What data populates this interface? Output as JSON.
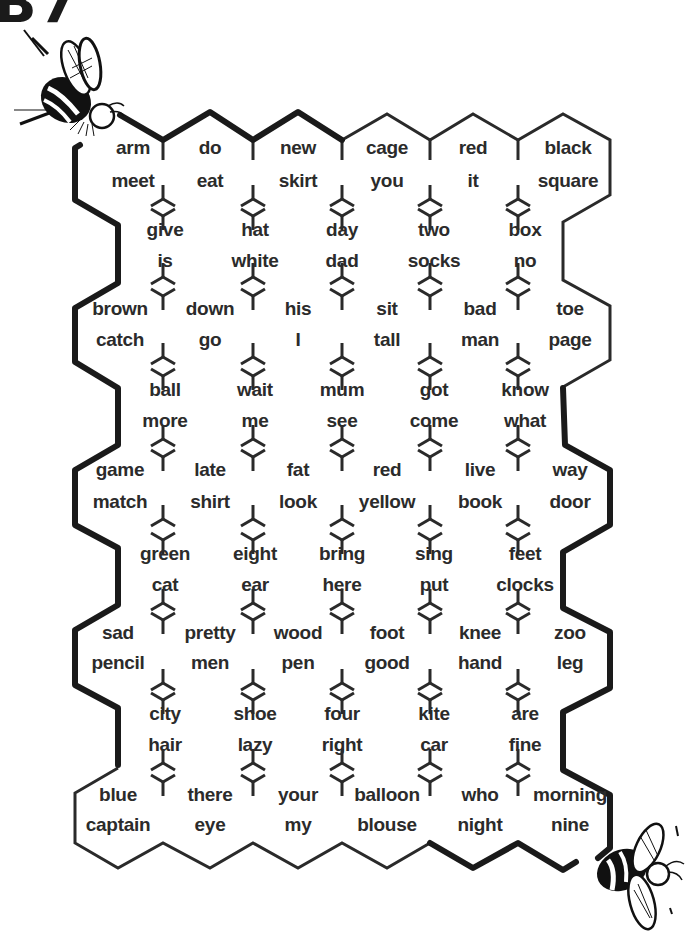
{
  "heading": "B7",
  "rows": [
    {
      "y1": 150,
      "y2": 183,
      "cells": [
        {
          "x": 133,
          "top": "arm",
          "bottom": "meet"
        },
        {
          "x": 210,
          "top": "do",
          "bottom": "eat"
        },
        {
          "x": 298,
          "top": "new",
          "bottom": "skirt"
        },
        {
          "x": 387,
          "top": "cage",
          "bottom": "you"
        },
        {
          "x": 473,
          "top": "red",
          "bottom": "it"
        },
        {
          "x": 568,
          "top": "black",
          "bottom": "square"
        }
      ]
    },
    {
      "y1": 232,
      "y2": 263,
      "cells": [
        {
          "x": 165,
          "top": "give",
          "bottom": "is"
        },
        {
          "x": 255,
          "top": "hat",
          "bottom": "white"
        },
        {
          "x": 342,
          "top": "day",
          "bottom": "dad"
        },
        {
          "x": 434,
          "top": "two",
          "bottom": "socks"
        },
        {
          "x": 525,
          "top": "box",
          "bottom": "no"
        }
      ]
    },
    {
      "y1": 311,
      "y2": 342,
      "cells": [
        {
          "x": 120,
          "top": "brown",
          "bottom": "catch"
        },
        {
          "x": 210,
          "top": "down",
          "bottom": "go"
        },
        {
          "x": 298,
          "top": "his",
          "bottom": "I"
        },
        {
          "x": 387,
          "top": "sit",
          "bottom": "tall"
        },
        {
          "x": 480,
          "top": "bad",
          "bottom": "man"
        },
        {
          "x": 570,
          "top": "toe",
          "bottom": "page"
        }
      ]
    },
    {
      "y1": 392,
      "y2": 423,
      "cells": [
        {
          "x": 165,
          "top": "ball",
          "bottom": "more"
        },
        {
          "x": 255,
          "top": "wait",
          "bottom": "me"
        },
        {
          "x": 342,
          "top": "mum",
          "bottom": "see"
        },
        {
          "x": 434,
          "top": "got",
          "bottom": "come"
        },
        {
          "x": 525,
          "top": "know",
          "bottom": "what"
        }
      ]
    },
    {
      "y1": 472,
      "y2": 504,
      "cells": [
        {
          "x": 120,
          "top": "game",
          "bottom": "match"
        },
        {
          "x": 210,
          "top": "late",
          "bottom": "shirt"
        },
        {
          "x": 298,
          "top": "fat",
          "bottom": "look"
        },
        {
          "x": 387,
          "top": "red",
          "bottom": "yellow"
        },
        {
          "x": 480,
          "top": "live",
          "bottom": "book"
        },
        {
          "x": 570,
          "top": "way",
          "bottom": "door"
        }
      ]
    },
    {
      "y1": 556,
      "y2": 587,
      "cells": [
        {
          "x": 165,
          "top": "green",
          "bottom": "cat"
        },
        {
          "x": 255,
          "top": "eight",
          "bottom": "ear"
        },
        {
          "x": 342,
          "top": "bring",
          "bottom": "here"
        },
        {
          "x": 434,
          "top": "sing",
          "bottom": "put"
        },
        {
          "x": 525,
          "top": "feet",
          "bottom": "clocks"
        }
      ]
    },
    {
      "y1": 635,
      "y2": 665,
      "cells": [
        {
          "x": 118,
          "top": "sad",
          "bottom": "pencil"
        },
        {
          "x": 210,
          "top": "pretty",
          "bottom": "men"
        },
        {
          "x": 298,
          "top": "wood",
          "bottom": "pen"
        },
        {
          "x": 387,
          "top": "foot",
          "bottom": "good"
        },
        {
          "x": 480,
          "top": "knee",
          "bottom": "hand"
        },
        {
          "x": 570,
          "top": "zoo",
          "bottom": "leg"
        }
      ]
    },
    {
      "y1": 716,
      "y2": 747,
      "cells": [
        {
          "x": 165,
          "top": "city",
          "bottom": "hair"
        },
        {
          "x": 255,
          "top": "shoe",
          "bottom": "lazy"
        },
        {
          "x": 342,
          "top": "four",
          "bottom": "right"
        },
        {
          "x": 434,
          "top": "kite",
          "bottom": "car"
        },
        {
          "x": 525,
          "top": "are",
          "bottom": "fine"
        }
      ]
    },
    {
      "y1": 797,
      "y2": 827,
      "cells": [
        {
          "x": 118,
          "top": "blue",
          "bottom": "captain"
        },
        {
          "x": 210,
          "top": "there",
          "bottom": "eye"
        },
        {
          "x": 298,
          "top": "your",
          "bottom": "my"
        },
        {
          "x": 387,
          "top": "balloon",
          "bottom": "blouse"
        },
        {
          "x": 480,
          "top": "who",
          "bottom": "night"
        },
        {
          "x": 570,
          "top": "morning",
          "bottom": "nine"
        }
      ]
    }
  ],
  "decorations": {
    "bee_top_left": "bee-illustration",
    "bee_bottom_right": "bee-illustration"
  }
}
